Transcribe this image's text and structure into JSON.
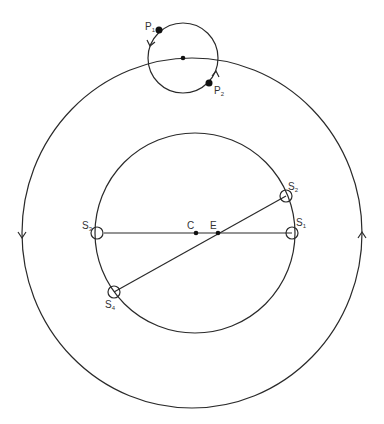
{
  "diagram": {
    "labels": {
      "P1": {
        "main": "P",
        "sub": "1"
      },
      "P2": {
        "main": "P",
        "sub": "2"
      },
      "S1": {
        "main": "S",
        "sub": "1"
      },
      "S2": {
        "main": "S",
        "sub": "2"
      },
      "S3": {
        "main": "S",
        "sub": "3"
      },
      "S4": {
        "main": "S",
        "sub": "4"
      },
      "C": "C",
      "E": "E"
    },
    "outer_direction_arrows": [
      "down-left",
      "up-right"
    ],
    "epicycle_direction_arrows": [
      "down",
      "up"
    ]
  }
}
